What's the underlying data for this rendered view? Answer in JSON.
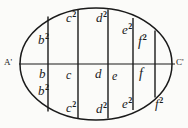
{
  "figure": {
    "axis": {
      "left_endpoint_label": "A'",
      "right_endpoint_label": "C'"
    },
    "colors": {
      "ink": "#1a1a1a",
      "paper": "#fbfbf9"
    },
    "labels": {
      "upper": [
        {
          "base": "b",
          "exp": "2"
        },
        {
          "base": "c",
          "exp": "2"
        },
        {
          "base": "d",
          "exp": "2"
        },
        {
          "base": "e",
          "exp": "2"
        },
        {
          "base": "f",
          "exp": "2"
        }
      ],
      "middle": [
        {
          "base": "b",
          "exp": ""
        },
        {
          "base": "c",
          "exp": ""
        },
        {
          "base": "d",
          "exp": ""
        },
        {
          "base": "e",
          "exp": ""
        },
        {
          "base": "f",
          "exp": ""
        }
      ],
      "lower_inner": [
        {
          "base": "b",
          "exp": "2"
        }
      ],
      "lower": [
        {
          "base": "c",
          "exp": "2"
        },
        {
          "base": "d",
          "exp": "2"
        },
        {
          "base": "e",
          "exp": "2"
        },
        {
          "base": "f",
          "exp": "2"
        }
      ]
    }
  }
}
